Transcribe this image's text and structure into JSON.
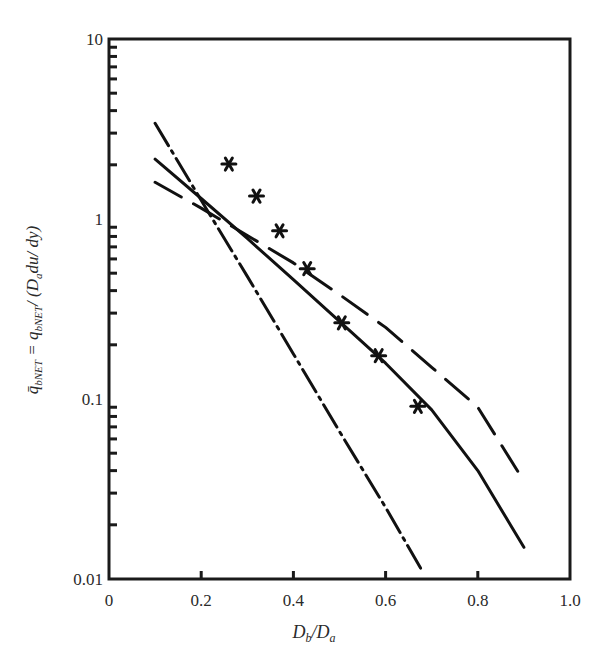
{
  "chart_data": {
    "type": "line",
    "title": "",
    "xlabel": "D_b/D_a",
    "ylabel": "q̄_bNET = q_bNET / (D_a du/dy)",
    "xscale": "linear",
    "yscale": "log",
    "xlim": [
      0,
      1.0
    ],
    "ylim": [
      0.01,
      10
    ],
    "grid": false,
    "legend": null,
    "x_ticks": [
      "0",
      "0.2",
      "0.4",
      "0.6",
      "0.8",
      "1.0"
    ],
    "y_ticks": [
      "0.01",
      "0.1",
      "1",
      "10"
    ],
    "series": [
      {
        "name": "solid line",
        "style": "solid",
        "x": [
          0.1,
          0.2,
          0.3,
          0.4,
          0.5,
          0.6,
          0.7,
          0.8,
          0.9
        ],
        "y": [
          2.15,
          1.3,
          0.78,
          0.46,
          0.27,
          0.158,
          0.087,
          0.04,
          0.015
        ]
      },
      {
        "name": "long-dash line",
        "style": "long-dash",
        "x": [
          0.1,
          0.2,
          0.3,
          0.4,
          0.5,
          0.6,
          0.7,
          0.8,
          0.9
        ],
        "y": [
          1.6,
          1.15,
          0.81,
          0.57,
          0.38,
          0.25,
          0.15,
          0.09,
          0.035
        ]
      },
      {
        "name": "dash-dot line",
        "style": "dash-dot",
        "x": [
          0.1,
          0.2,
          0.3,
          0.4,
          0.5,
          0.6,
          0.68
        ],
        "y": [
          3.4,
          1.27,
          0.48,
          0.178,
          0.066,
          0.025,
          0.011
        ]
      },
      {
        "name": "measured data",
        "style": "markers-asterisk",
        "x": [
          0.26,
          0.32,
          0.37,
          0.43,
          0.505,
          0.585,
          0.67
        ],
        "y": [
          2.02,
          1.34,
          0.86,
          0.53,
          0.265,
          0.174,
          0.091
        ]
      }
    ]
  },
  "axes": {
    "x_label_main": "D",
    "x_label_sub1": "b",
    "x_label_slash": "/D",
    "x_label_sub2": "a",
    "y_label_text": "q̄bNET = qbNET / (Da du/ dy)"
  }
}
